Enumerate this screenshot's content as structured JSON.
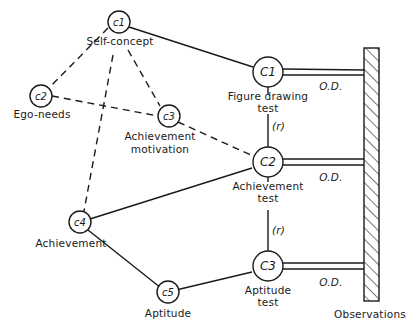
{
  "diagram": {
    "latent_constructs": [
      {
        "id": "c1",
        "symbol": "c1",
        "label": "Self-concept"
      },
      {
        "id": "c2",
        "symbol": "c2",
        "label": "Ego-needs"
      },
      {
        "id": "c3",
        "symbol": "c3",
        "label_line1": "Achievement",
        "label_line2": "motivation"
      },
      {
        "id": "c4",
        "symbol": "c4",
        "label": "Achievement"
      },
      {
        "id": "c5",
        "symbol": "c5",
        "label": "Aptitude"
      }
    ],
    "tests": [
      {
        "id": "C1",
        "symbol": "C1",
        "label_line1": "Figure drawing",
        "label_line2": "test"
      },
      {
        "id": "C2",
        "symbol": "C2",
        "label_line1": "Achievement",
        "label_line2": "test"
      },
      {
        "id": "C3",
        "symbol": "C3",
        "label_line1": "Aptitude",
        "label_line2": "test"
      }
    ],
    "relations": {
      "r_label_1": "(r)",
      "r_label_2": "(r)"
    },
    "operational_definitions": [
      "O.D.",
      "O.D.",
      "O.D."
    ],
    "observations_label": "Observations",
    "edges": [
      {
        "from": "c1",
        "to": "c2",
        "style": "dashed"
      },
      {
        "from": "c1",
        "to": "c3",
        "style": "dashed"
      },
      {
        "from": "c1",
        "to": "c4",
        "style": "dashed"
      },
      {
        "from": "c2",
        "to": "c3",
        "style": "dashed"
      },
      {
        "from": "c3",
        "to": "C2",
        "style": "dashed"
      },
      {
        "from": "c1",
        "to": "C1",
        "style": "solid"
      },
      {
        "from": "c4",
        "to": "C2",
        "style": "solid"
      },
      {
        "from": "c4",
        "to": "c5",
        "style": "solid"
      },
      {
        "from": "c5",
        "to": "C3",
        "style": "solid"
      },
      {
        "from": "C1",
        "to": "C2",
        "style": "solid",
        "label": "(r)"
      },
      {
        "from": "C2",
        "to": "C3",
        "style": "solid",
        "label": "(r)"
      },
      {
        "from": "C1",
        "to": "Observations",
        "style": "double",
        "label": "O.D."
      },
      {
        "from": "C2",
        "to": "Observations",
        "style": "double",
        "label": "O.D."
      },
      {
        "from": "C3",
        "to": "Observations",
        "style": "double",
        "label": "O.D."
      }
    ]
  }
}
